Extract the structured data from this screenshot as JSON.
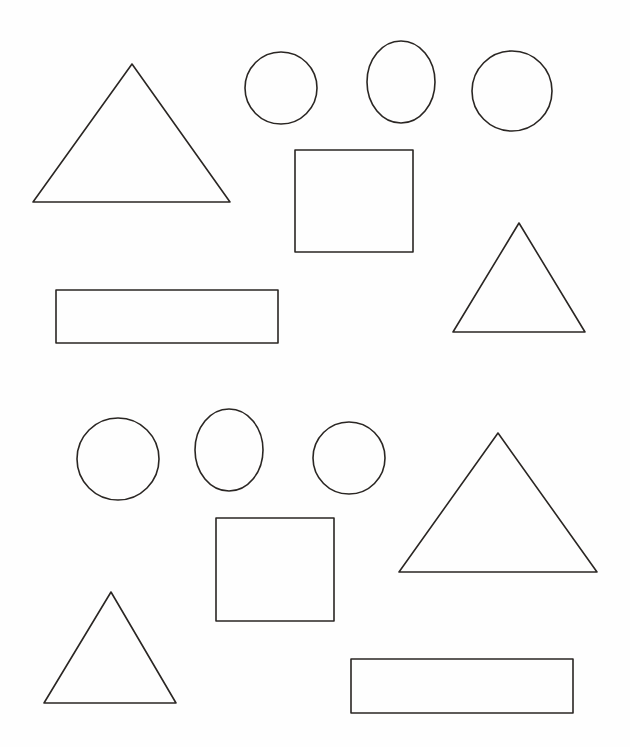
{
  "page": {
    "background": "#fefefe",
    "stroke_color": "#2a2623",
    "width": 630,
    "height": 747
  },
  "sections": [
    {
      "id": "top",
      "shapes": [
        {
          "type": "triangle",
          "name": "large-triangle",
          "points": [
            [
              132,
              64
            ],
            [
              33,
              202
            ],
            [
              230,
              202
            ]
          ]
        },
        {
          "type": "circle",
          "name": "circle",
          "cx": 281,
          "cy": 88,
          "rx": 36,
          "ry": 36
        },
        {
          "type": "ellipse",
          "name": "oval",
          "cx": 401,
          "cy": 82,
          "rx": 34,
          "ry": 41
        },
        {
          "type": "circle",
          "name": "circle",
          "cx": 512,
          "cy": 91,
          "rx": 40,
          "ry": 40
        },
        {
          "type": "rect",
          "name": "square",
          "x": 295,
          "y": 150,
          "w": 118,
          "h": 102
        },
        {
          "type": "triangle",
          "name": "small-triangle",
          "points": [
            [
              519,
              223
            ],
            [
              453,
              332
            ],
            [
              585,
              332
            ]
          ]
        },
        {
          "type": "rect",
          "name": "long-rectangle",
          "x": 56,
          "y": 290,
          "w": 222,
          "h": 53
        }
      ]
    },
    {
      "id": "bottom",
      "shapes": [
        {
          "type": "circle",
          "name": "circle",
          "cx": 118,
          "cy": 459,
          "rx": 41,
          "ry": 41
        },
        {
          "type": "ellipse",
          "name": "oval",
          "cx": 229,
          "cy": 450,
          "rx": 34,
          "ry": 41
        },
        {
          "type": "circle",
          "name": "circle",
          "cx": 349,
          "cy": 458,
          "rx": 36,
          "ry": 36
        },
        {
          "type": "triangle",
          "name": "large-triangle",
          "points": [
            [
              498,
              433
            ],
            [
              399,
              572
            ],
            [
              597,
              572
            ]
          ]
        },
        {
          "type": "rect",
          "name": "square",
          "x": 216,
          "y": 518,
          "w": 118,
          "h": 103
        },
        {
          "type": "triangle",
          "name": "small-triangle",
          "points": [
            [
              111,
              592
            ],
            [
              44,
              703
            ],
            [
              176,
              703
            ]
          ]
        },
        {
          "type": "rect",
          "name": "long-rectangle",
          "x": 351,
          "y": 659,
          "w": 222,
          "h": 54
        }
      ]
    }
  ]
}
